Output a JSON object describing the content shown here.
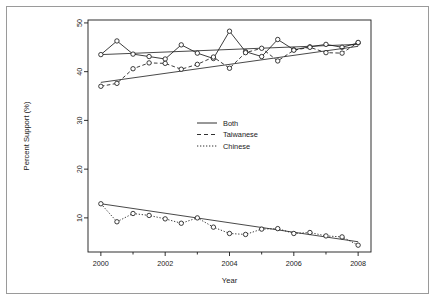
{
  "figure": {
    "background_color": "#ffffff",
    "ink_color": "#1a1a1a",
    "border_color": "#9a9a9a",
    "has_outer_border": true
  },
  "chart_data": {
    "type": "line",
    "title": "",
    "subtitle": "",
    "xlabel": "Year",
    "ylabel": "Percent Support (%)",
    "xlim": [
      1999.6,
      2008.4
    ],
    "ylim": [
      3.0,
      50.6
    ],
    "grid": false,
    "legend_position": "center",
    "x_ticks": [
      2000,
      2002,
      2004,
      2006,
      2008
    ],
    "x_tick_labels": [
      "2000",
      "2002",
      "2004",
      "2006",
      "2008"
    ],
    "x_minor_ticks": [
      2001,
      2003,
      2005,
      2007
    ],
    "y_ticks": [
      10,
      20,
      30,
      40,
      50
    ],
    "y_tick_labels": [
      "10",
      "20",
      "30",
      "40",
      "50"
    ],
    "marker": "open-circle",
    "series": [
      {
        "name": "Both",
        "line_style": "solid",
        "x": [
          2000.0,
          2000.5,
          2001.0,
          2001.5,
          2002.0,
          2002.5,
          2003.0,
          2003.5,
          2004.0,
          2004.5,
          2005.0,
          2005.5,
          2006.0,
          2006.5,
          2007.0,
          2007.5,
          2008.0
        ],
        "values": [
          43.5,
          46.3,
          43.6,
          43.1,
          42.6,
          45.5,
          43.8,
          42.7,
          48.3,
          44.1,
          43.1,
          46.6,
          44.5,
          45.1,
          45.6,
          45.0,
          45.9
        ],
        "trend_start": [
          2000.0,
          43.5
        ],
        "trend_end": [
          2008.0,
          45.6
        ]
      },
      {
        "name": "Taiwanese",
        "line_style": "dashed",
        "x": [
          2000.0,
          2000.5,
          2001.0,
          2001.5,
          2002.0,
          2002.5,
          2003.0,
          2003.5,
          2004.0,
          2004.5,
          2005.0,
          2005.5,
          2006.0,
          2006.5,
          2007.0,
          2007.5,
          2008.0
        ],
        "values": [
          37.0,
          37.6,
          40.6,
          41.8,
          41.7,
          40.5,
          41.5,
          43.0,
          40.7,
          43.9,
          44.8,
          42.2,
          44.4,
          45.0,
          43.9,
          43.8,
          46.0
        ],
        "trend_start": [
          2000.0,
          37.8
        ],
        "trend_end": [
          2008.0,
          45.2
        ]
      },
      {
        "name": "Chinese",
        "line_style": "dotted",
        "x": [
          2000.0,
          2000.5,
          2001.0,
          2001.5,
          2002.0,
          2002.5,
          2003.0,
          2003.5,
          2004.0,
          2004.5,
          2005.0,
          2005.5,
          2006.0,
          2006.5,
          2007.0,
          2007.5,
          2008.0
        ],
        "values": [
          12.9,
          9.2,
          10.9,
          10.5,
          9.8,
          8.9,
          10.0,
          8.1,
          6.8,
          6.6,
          7.7,
          7.8,
          6.8,
          7.0,
          6.3,
          6.1,
          4.4
        ],
        "trend_start": [
          2000.0,
          12.9
        ],
        "trend_end": [
          2008.0,
          5.1
        ]
      }
    ]
  },
  "legend": {
    "entries": [
      {
        "label": "Both",
        "style": "solid"
      },
      {
        "label": "Taiwanese",
        "style": "dashed"
      },
      {
        "label": "Chinese",
        "style": "dotted"
      }
    ]
  }
}
